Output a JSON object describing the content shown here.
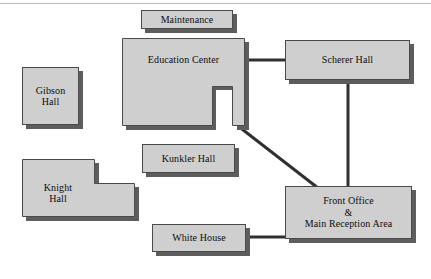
{
  "diagram": {
    "type": "campus-site-plan",
    "background_color": "#ffffff",
    "building_fill_color": "#cfcfcf",
    "building_border_color": "#4a4a4a",
    "building_shadow_color": "#5d5d5d",
    "connector_color": "#303030",
    "top_rule_color": "#b9b9b9"
  },
  "buildings": [
    {
      "id": "maintenance",
      "name": "Maintenance",
      "lines": [
        "Maintenance"
      ],
      "shape": "rectangle",
      "x": 141,
      "y": 10,
      "w": 92,
      "h": 19
    },
    {
      "id": "education-center",
      "name": "Education Center",
      "lines": [
        "Education Center"
      ],
      "shape": "u-shape",
      "x": 122,
      "y": 38,
      "w": 123,
      "h": 88
    },
    {
      "id": "scherer-hall",
      "name": "Scherer Hall",
      "lines": [
        "Scherer Hall"
      ],
      "shape": "rectangle",
      "x": 285,
      "y": 40,
      "w": 125,
      "h": 40
    },
    {
      "id": "gibson-hall",
      "name": "Gibson Hall",
      "lines": [
        "Gibson",
        "Hall"
      ],
      "shape": "rectangle",
      "x": 22,
      "y": 67,
      "w": 57,
      "h": 58
    },
    {
      "id": "kunkler-hall",
      "name": "Kunkler Hall",
      "lines": [
        "Kunkler Hall"
      ],
      "shape": "rectangle",
      "x": 142,
      "y": 144,
      "w": 93,
      "h": 29
    },
    {
      "id": "knight-hall",
      "name": "Knight Hall",
      "lines": [
        "Knight",
        "Hall"
      ],
      "shape": "l-shape",
      "x": 22,
      "y": 159,
      "w": 113,
      "h": 58
    },
    {
      "id": "front-office",
      "name": "Front Office & Main Reception Area",
      "lines": [
        "Front Office",
        "&",
        "Main Reception Area"
      ],
      "shape": "rectangle",
      "x": 285,
      "y": 186,
      "w": 127,
      "h": 53
    },
    {
      "id": "white-house",
      "name": "White House",
      "lines": [
        "White House"
      ],
      "shape": "rectangle",
      "x": 152,
      "y": 224,
      "w": 94,
      "h": 28
    }
  ],
  "connections": [
    {
      "id": "education-center-to-scherer-hall",
      "from": "education-center",
      "to": "scherer-hall",
      "orientation": "horizontal",
      "x1": 245,
      "y1": 60,
      "x2": 286,
      "y2": 60
    },
    {
      "id": "scherer-hall-to-front-office",
      "from": "scherer-hall",
      "to": "front-office",
      "orientation": "vertical",
      "x1": 348,
      "y1": 80,
      "x2": 348,
      "y2": 187
    },
    {
      "id": "education-center-to-front-office",
      "from": "education-center",
      "to": "front-office",
      "orientation": "diagonal",
      "x1": 238,
      "y1": 126,
      "x2": 316,
      "y2": 187
    },
    {
      "id": "white-house-to-front-office",
      "from": "white-house",
      "to": "front-office",
      "orientation": "horizontal",
      "x1": 246,
      "y1": 237,
      "x2": 286,
      "y2": 237
    }
  ]
}
